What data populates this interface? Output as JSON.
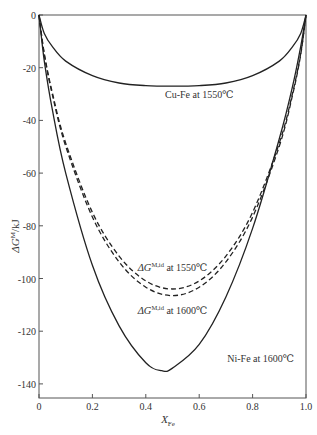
{
  "chart_data": {
    "type": "line",
    "title": "",
    "xlabel": "X_Fe",
    "xlabel_main": "X",
    "xlabel_sub": "Fe",
    "ylabel": "ΔG^M/kJ",
    "ylabel_main": "ΔG",
    "ylabel_sup": "M",
    "ylabel_unit": "/kJ",
    "xlim": [
      0,
      1.0
    ],
    "ylim": [
      -143,
      0
    ],
    "xticks": [
      0,
      0.2,
      0.4,
      0.6,
      0.8,
      1.0
    ],
    "xtick_labels": [
      "0",
      "0.2",
      "0.4",
      "0.6",
      "0.8",
      "1.0"
    ],
    "yticks": [
      0,
      -20,
      -40,
      -60,
      -80,
      -100,
      -120,
      -140
    ],
    "ytick_labels": [
      "0",
      "-20",
      "-40",
      "-60",
      "-80",
      "-100",
      "-120",
      "-140"
    ],
    "grid": false,
    "legend": "none (inline annotations)",
    "series": [
      {
        "name": "Cu-Fe at 1550℃",
        "style": "solid",
        "min_x": 0.5,
        "min_y": -27,
        "x": [
          0,
          0.02,
          0.05,
          0.1,
          0.2,
          0.3,
          0.4,
          0.5,
          0.6,
          0.7,
          0.8,
          0.9,
          0.95,
          0.98,
          1.0
        ],
        "values": [
          0,
          -7,
          -12,
          -17.5,
          -23,
          -25.8,
          -26.8,
          -27,
          -26.8,
          -25.8,
          -23,
          -17.5,
          -12,
          -7,
          0
        ]
      },
      {
        "name": "ΔG^M,id at 1550℃",
        "style": "dashed",
        "min_x": 0.5,
        "min_y": -104,
        "x": [
          0,
          0.02,
          0.05,
          0.1,
          0.2,
          0.3,
          0.4,
          0.5,
          0.6,
          0.7,
          0.8,
          0.9,
          0.95,
          0.98,
          1.0
        ],
        "values": [
          0,
          -14.7,
          -29.6,
          -48.6,
          -74.9,
          -91.5,
          -100.9,
          -104,
          -100.9,
          -91.5,
          -74.9,
          -48.6,
          -29.6,
          -14.7,
          0
        ]
      },
      {
        "name": "ΔG^M,id at 1600℃",
        "style": "dashed",
        "min_x": 0.5,
        "min_y": -106.5,
        "x": [
          0,
          0.02,
          0.05,
          0.1,
          0.2,
          0.3,
          0.4,
          0.5,
          0.6,
          0.7,
          0.8,
          0.9,
          0.95,
          0.98,
          1.0
        ],
        "values": [
          0,
          -15.1,
          -30.3,
          -49.8,
          -76.7,
          -93.7,
          -103.3,
          -106.5,
          -103.3,
          -93.7,
          -76.7,
          -49.8,
          -30.3,
          -15.1,
          0
        ]
      },
      {
        "name": "Ni-Fe at 1600℃",
        "style": "solid",
        "min_x": 0.46,
        "min_y": -135,
        "x": [
          0,
          0.02,
          0.05,
          0.1,
          0.2,
          0.3,
          0.4,
          0.46,
          0.5,
          0.6,
          0.7,
          0.8,
          0.9,
          0.95,
          0.98,
          1.0
        ],
        "values": [
          0,
          -17.5,
          -36,
          -60,
          -95,
          -118,
          -132,
          -135,
          -134,
          -125,
          -107,
          -81,
          -47,
          -27,
          -12,
          0
        ]
      }
    ],
    "annotations": [
      {
        "text": "Cu-Fe at 1550℃",
        "x": 0.6,
        "y": -31.5
      },
      {
        "main": "ΔG",
        "sup": "M,id",
        "rest": " at 1550℃",
        "x": 0.5,
        "y": -97
      },
      {
        "main": "ΔG",
        "sup": "M,id",
        "rest": " at 1600℃",
        "x": 0.5,
        "y": -113.5
      },
      {
        "text": "Ni-Fe at 1600℃",
        "x": 0.83,
        "y": -131.5
      }
    ]
  }
}
